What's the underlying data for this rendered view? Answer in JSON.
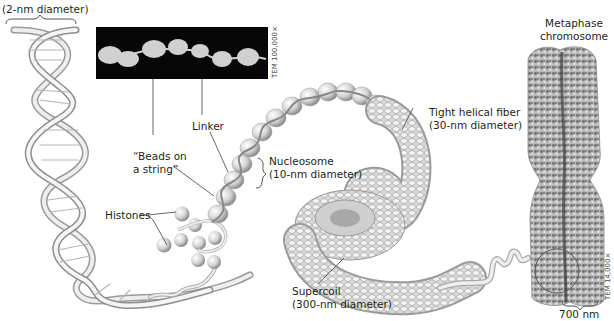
{
  "diagram": {
    "colors": {
      "background": "#ffffff",
      "text": "#231f20",
      "structure_light": "#e8e8e8",
      "structure_shade": "#9a9a9a",
      "micrograph_bg": "#070707",
      "leader_line": "#555555"
    },
    "labels": {
      "dna_diameter": "(2-nm diameter)",
      "beads_line1": "“Beads on",
      "beads_line2": "a string”",
      "linker": "Linker",
      "nucleosome_line1": "Nucleosome",
      "nucleosome_line2": "(10-nm diameter)",
      "histones": "Histones",
      "fiber_line1": "Tight helical fiber",
      "fiber_line2": "(30-nm diameter)",
      "supercoil_line1": "Supercoil",
      "supercoil_line2": "(300-nm diameter)",
      "metaphase_line1": "Metaphase",
      "metaphase_line2": "chromosome",
      "scale_700": "700 nm",
      "tem_top": "TEM 100,000×",
      "tem_bottom": "TEM 14,000×"
    }
  }
}
